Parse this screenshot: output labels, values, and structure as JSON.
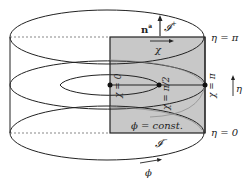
{
  "diagram": {
    "type": "conformal cylinder slice",
    "labels": {
      "normal": "n",
      "normal_sup": "a",
      "scri_plus": "𝓘",
      "scri_plus_sup": "+",
      "scri_minus": "𝓘",
      "scri_minus_sup": "−",
      "chi_arrow": "χ",
      "eta_top": "η = π",
      "eta_bottom": "η = 0",
      "eta_arrow": "η",
      "chi_zero": "χ = 0",
      "chi_half_pi": "χ = π/2",
      "chi_pi": "χ = π",
      "phi_const": "ϕ = const.",
      "phi_arrow": "ϕ"
    },
    "colors": {
      "shaded_region": "#c8c8c8",
      "stroke": "#222222",
      "background": "#ffffff"
    }
  }
}
